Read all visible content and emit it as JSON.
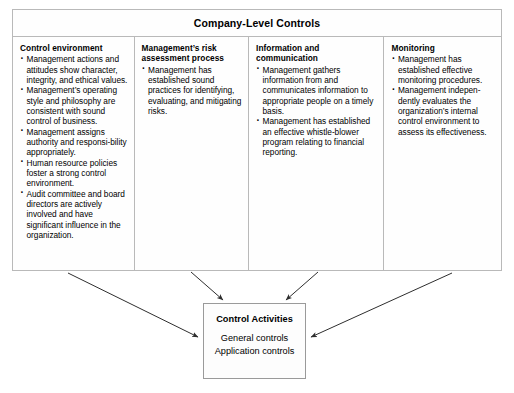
{
  "diagram": {
    "type": "block-diagram",
    "title": "Company-Level Controls",
    "columns": [
      {
        "title": "Control environment",
        "bullets": [
          "Management actions and attitudes show character, integrity, and ethical values.",
          "Management’s operating style and philosophy are consistent with sound control of business.",
          "Management assigns authority and responsi-bility appropriately.",
          "Human resource policies foster a strong control environment.",
          "Audit committee and board directors are actively involved and have significant influence in the organization."
        ]
      },
      {
        "title": "Management’s risk assessment process",
        "bullets": [
          "Management has established sound practices for identifying, evaluating, and mitigating risks."
        ]
      },
      {
        "title": "Information and communication",
        "bullets": [
          "Management gathers information from and communicates information to appropriate people on a timely basis.",
          "Management has established an effective whistle-blower program relating to financial reporting."
        ]
      },
      {
        "title": "Monitoring",
        "bullets": [
          "Management has established effective monitoring procedures.",
          "Management indepen-dently evaluates the organization’s internal control environment to assess its effectiveness."
        ]
      }
    ],
    "target_box": {
      "title": "Control Activities",
      "lines": [
        "General controls",
        "Application controls"
      ]
    },
    "arrow_count": 4,
    "colors": {
      "border": "#b9b9b9",
      "arrow": "#2e2e2e",
      "text": "#000000",
      "background": "#ffffff"
    }
  }
}
